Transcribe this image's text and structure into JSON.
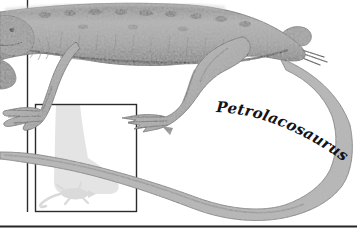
{
  "figure": {
    "species_label": "Petrolacosaurus",
    "colors": {
      "background": "#ffffff",
      "frame_line": "#2b2b2b",
      "baseline_rule": "#262626",
      "body_dark": "#5c5c5c",
      "body_mid": "#a3a3a3",
      "body_light": "#d6d6d6",
      "tail": "#b5b5b5",
      "outline": "#4f4f4f",
      "ghost_leg": "#e4e4e4",
      "ghost_lizard": "#dadada",
      "label_text": "#141414"
    }
  }
}
